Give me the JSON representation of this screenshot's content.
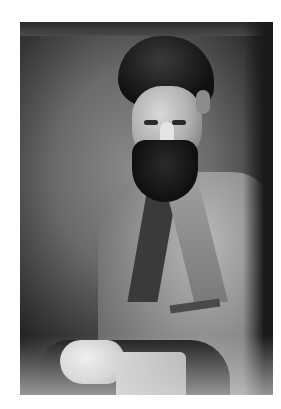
{
  "image": {
    "type": "photograph",
    "style": "black-and-white vintage portrait",
    "subject": "bearded man in tweed jacket, seated, hands resting on chair arm",
    "background_color": "#ffffff",
    "photo_tones": {
      "dark": "#111111",
      "mid": "#7a7a7a",
      "light": "#e4e4e4"
    }
  }
}
